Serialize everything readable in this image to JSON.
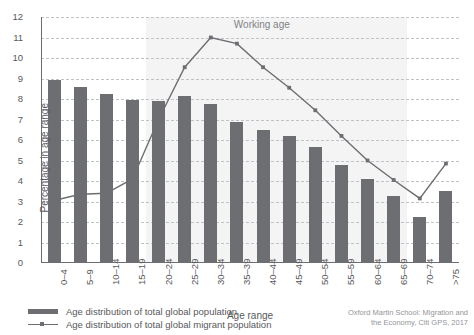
{
  "chart_data": {
    "type": "bar",
    "title": "",
    "xlabel": "Age range",
    "ylabel": "Percentage in age range",
    "ylim": [
      0,
      12
    ],
    "yticks": [
      0,
      1,
      2,
      3,
      4,
      5,
      6,
      7,
      8,
      9,
      10,
      11,
      12
    ],
    "grid": true,
    "legend_position": "bottom-left",
    "categories": [
      "0–4",
      "5–9",
      "10–14",
      "15–19",
      "20–24",
      "25–29",
      "30–34",
      "35–39",
      "40–44",
      "45–49",
      "50–54",
      "55–59",
      "60–64",
      "65–69",
      "70–74",
      ">75"
    ],
    "series": [
      {
        "name": "Age distribution of total global population",
        "type": "bar",
        "color": "#6d6e71",
        "values": [
          8.95,
          8.6,
          8.25,
          7.95,
          7.9,
          8.15,
          7.75,
          6.9,
          6.5,
          6.2,
          5.65,
          4.8,
          4.1,
          3.25,
          2.25,
          3.5
        ]
      },
      {
        "name": "Age distribution of total global migrant population",
        "type": "line",
        "color": "#6d6e71",
        "values": [
          3.05,
          3.35,
          3.4,
          4.1,
          7.0,
          9.55,
          11.0,
          10.7,
          9.55,
          8.55,
          7.45,
          6.2,
          5.0,
          4.05,
          3.15,
          4.85
        ]
      }
    ],
    "annotations": [
      {
        "text": "Working age",
        "x_category": "30–34",
        "y": 11.6
      }
    ],
    "shaded_band": {
      "from_category": "20–24",
      "to_category": "65–69",
      "color": "#f4f4f4"
    }
  },
  "axis": {
    "y_title": "Percentage in age range",
    "x_title": "Age range",
    "y_ticks": [
      "12",
      "11",
      "10",
      "9",
      "8",
      "7",
      "6",
      "5",
      "4",
      "3",
      "2",
      "1",
      "0"
    ],
    "x_ticks": [
      "0–4",
      "5–9",
      "10–14",
      "15–19",
      "20–24",
      "25–29",
      "30–34",
      "35–39",
      "40–44",
      "45–49",
      "50–54",
      "55–59",
      "60–64",
      "65–69",
      "70–74",
      ">75"
    ]
  },
  "annotation": {
    "working_age": "Working age"
  },
  "legend": {
    "items": [
      {
        "label": "Age distribution of total global population",
        "marker": "bar-swatch"
      },
      {
        "label": "Age distribution of total global migrant population",
        "marker": "line-marker-swatch"
      }
    ]
  },
  "source": {
    "text": "Oxford Martin School: Migration and\nthe Economy, Citi GPS, 2017"
  },
  "colors": {
    "bar": "#6d6e71",
    "line": "#6d6e71",
    "grid": "#bfc3c9",
    "band": "#f4f4f4",
    "text": "#58595b",
    "annotation": "#808285",
    "source": "#939598"
  }
}
